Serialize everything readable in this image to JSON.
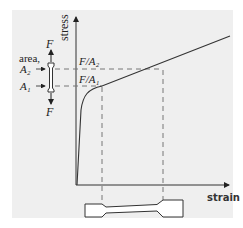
{
  "diagram": {
    "axes": {
      "y_label": "stress",
      "x_label": "strain"
    },
    "annotations": {
      "level_high": "F/A₂",
      "level_low": "F/A₁",
      "area_label": "area,",
      "area_high": "A₂",
      "area_low": "A₁",
      "force_top": "F",
      "force_bottom": "F"
    },
    "colors": {
      "background": "#efefef",
      "line": "#333333",
      "dashed": "#777777"
    }
  }
}
